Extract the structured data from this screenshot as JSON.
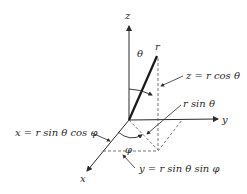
{
  "diagram": {
    "axes": {
      "x": "x",
      "y": "y",
      "z": "z"
    },
    "point_label": "r",
    "angles": {
      "polar": "θ",
      "azimuth": "φ"
    },
    "annotations": {
      "z_component": "z = r cos θ",
      "projection": "r sin θ",
      "x_component": "x = r sin θ cos φ",
      "y_component": "y = r sin θ sin φ"
    },
    "colors": {
      "ink": "#2a2a2a",
      "background": "#ffffff"
    }
  }
}
